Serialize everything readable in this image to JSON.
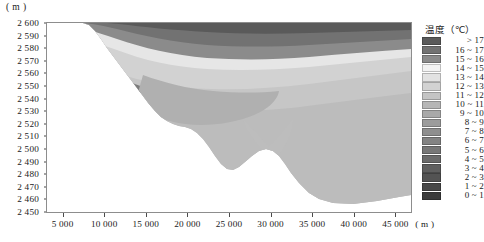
{
  "figure": {
    "y_unit_label": "( m )",
    "x_unit_label": "( m )"
  },
  "y_axis": {
    "label": "( m )",
    "ticks": [
      "2 600",
      "2 590",
      "2 580",
      "2 570",
      "2 560",
      "2 550",
      "2 540",
      "2 530",
      "2 520",
      "2 510",
      "2 500",
      "2 490",
      "2 480",
      "2 470",
      "2 460",
      "2 450"
    ],
    "min": 2450,
    "max": 2600
  },
  "x_axis": {
    "label": "( m )",
    "ticks": [
      "5 000",
      "10 000",
      "15 000",
      "20 000",
      "25 000",
      "30 000",
      "35 000",
      "40 000",
      "45 000"
    ],
    "min": 3000,
    "max": 47000
  },
  "legend": {
    "title": "温度（℃）",
    "entries": [
      {
        "label": "> 17",
        "color": "#5a5a5a"
      },
      {
        "label": "16 ~ 17",
        "color": "#727272"
      },
      {
        "label": "15 ~ 16",
        "color": "#8b8b8b"
      },
      {
        "label": "14 ~ 15",
        "color": "#f2f2f2"
      },
      {
        "label": "13 ~ 14",
        "color": "#e2e2e2"
      },
      {
        "label": "12 ~ 13",
        "color": "#d2d2d2"
      },
      {
        "label": "11 ~ 12",
        "color": "#c4c4c4"
      },
      {
        "label": "10 ~ 11",
        "color": "#b6b6b6"
      },
      {
        "label": "9 ~ 10",
        "color": "#a9a9a9"
      },
      {
        "label": "8 ~ 9",
        "color": "#9c9c9c"
      },
      {
        "label": "7 ~ 8",
        "color": "#8f8f8f"
      },
      {
        "label": "6 ~ 7",
        "color": "#838383"
      },
      {
        "label": "5 ~ 6",
        "color": "#777777"
      },
      {
        "label": "4 ~ 5",
        "color": "#6b6b6b"
      },
      {
        "label": "3 ~ 4",
        "color": "#5f5f5f"
      },
      {
        "label": "2 ~ 3",
        "color": "#535353"
      },
      {
        "label": "1 ~ 2",
        "color": "#474747"
      },
      {
        "label": "0 ~ 1",
        "color": "#3b3b3b"
      }
    ]
  },
  "chart_data": {
    "type": "heatmap",
    "title": "",
    "xlabel": "( m )",
    "ylabel": "( m )",
    "xlim": [
      3000,
      47000
    ],
    "ylim": [
      2450,
      2600
    ],
    "grid": false,
    "legend_position": "right",
    "variable": "温度（℃）",
    "bands": [
      {
        "name": "> 17",
        "color": "#5a5a5a",
        "value_min": 17,
        "value_max": null
      },
      {
        "name": "16 ~ 17",
        "color": "#727272",
        "value_min": 16,
        "value_max": 17
      },
      {
        "name": "15 ~ 16",
        "color": "#8b8b8b",
        "value_min": 15,
        "value_max": 16
      },
      {
        "name": "14 ~ 15",
        "color": "#f2f2f2",
        "value_min": 14,
        "value_max": 15
      },
      {
        "name": "13 ~ 14",
        "color": "#e2e2e2",
        "value_min": 13,
        "value_max": 14
      },
      {
        "name": "12 ~ 13",
        "color": "#d2d2d2",
        "value_min": 12,
        "value_max": 13
      },
      {
        "name": "11 ~ 12",
        "color": "#c4c4c4",
        "value_min": 11,
        "value_max": 12
      },
      {
        "name": "10 ~ 11",
        "color": "#b6b6b6",
        "value_min": 10,
        "value_max": 11
      },
      {
        "name": "9 ~ 10",
        "color": "#a9a9a9",
        "value_min": 9,
        "value_max": 10
      },
      {
        "name": "8 ~ 9",
        "color": "#9c9c9c",
        "value_min": 8,
        "value_max": 9
      },
      {
        "name": "7 ~ 8",
        "color": "#8f8f8f",
        "value_min": 7,
        "value_max": 8
      },
      {
        "name": "6 ~ 7",
        "color": "#838383",
        "value_min": 6,
        "value_max": 7
      },
      {
        "name": "5 ~ 6",
        "color": "#777777",
        "value_min": 5,
        "value_max": 6
      },
      {
        "name": "4 ~ 5",
        "color": "#6b6b6b",
        "value_min": 4,
        "value_max": 5
      },
      {
        "name": "3 ~ 4",
        "color": "#5f5f5f",
        "value_min": 3,
        "value_max": 4
      },
      {
        "name": "2 ~ 3",
        "color": "#535353",
        "value_min": 2,
        "value_max": 3
      },
      {
        "name": "1 ~ 2",
        "color": "#474747",
        "value_min": 1,
        "value_max": 2
      },
      {
        "name": "0 ~ 1",
        "color": "#3b3b3b",
        "value_min": 0,
        "value_max": 1
      }
    ]
  }
}
